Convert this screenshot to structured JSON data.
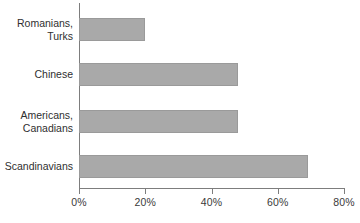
{
  "chart_data": {
    "type": "bar",
    "orientation": "horizontal",
    "title": "",
    "subtitle": "",
    "xlabel": "",
    "ylabel": "",
    "categories": [
      "Romanians,\nTurks",
      "Chinese",
      "Americans,\nCanadians",
      "Scandinavians"
    ],
    "values": [
      20,
      48,
      48,
      69
    ],
    "value_unit": "%",
    "xlim": [
      0,
      80
    ],
    "x_ticks": [
      0,
      20,
      40,
      60,
      80
    ],
    "x_tick_labels": [
      "0%",
      "20%",
      "40%",
      "60%",
      "80%"
    ],
    "grid": false,
    "legend": null,
    "legend_position": "none",
    "series": [
      {
        "name": "",
        "values": [
          20,
          48,
          48,
          69
        ]
      }
    ],
    "colors": {
      "bar_fill": "#a9a9a9",
      "bar_border": "#9a9a9a",
      "axis": "#7d7d7d",
      "text": "#2f2f2f",
      "background": "#ffffff"
    }
  }
}
